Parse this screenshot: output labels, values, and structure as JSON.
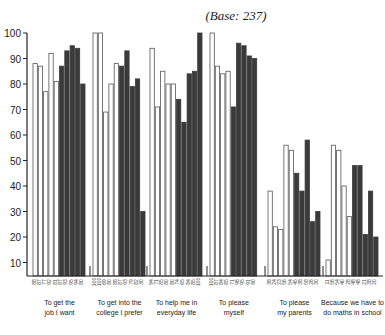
{
  "chart_data": {
    "type": "bar",
    "title": "(Base: 237)",
    "xlabel": "",
    "ylabel": "",
    "ylim": [
      0,
      100
    ],
    "yticks": [
      10,
      20,
      30,
      40,
      50,
      60,
      70,
      80,
      90,
      100
    ],
    "grid": false,
    "legend": "none",
    "categories": [
      [
        "To get the",
        "job I want"
      ],
      [
        "To get into the",
        "college I prefer"
      ],
      [
        "To help me in",
        "everyday life"
      ],
      [
        "To please",
        "myself"
      ],
      [
        "To please",
        "my parents"
      ],
      [
        "Because we have to",
        "do maths in school"
      ]
    ],
    "groups": [
      {
        "white": [
          88,
          87,
          77,
          92,
          81
        ],
        "dark": [
          87,
          93,
          95,
          94,
          80
        ]
      },
      {
        "white": [
          100,
          100,
          69,
          80,
          88
        ],
        "dark": [
          87,
          93,
          79,
          82,
          30
        ]
      },
      {
        "white": [
          94,
          71,
          85,
          80,
          80
        ],
        "dark": [
          74,
          65,
          84,
          85,
          100
        ]
      },
      {
        "white": [
          100,
          87,
          84,
          85
        ],
        "dark": [
          71,
          96,
          95,
          91,
          90
        ]
      },
      {
        "white": [
          38,
          24,
          23,
          56,
          54
        ],
        "dark": [
          45,
          38,
          58,
          26,
          30
        ]
      },
      {
        "white": [
          11,
          56,
          54,
          40,
          28
        ],
        "dark": [
          48,
          48,
          21,
          38,
          20
        ]
      }
    ],
    "colors": {
      "white": "#ffffff",
      "dark": "#3a3a3a",
      "outline": "#555555"
    }
  }
}
